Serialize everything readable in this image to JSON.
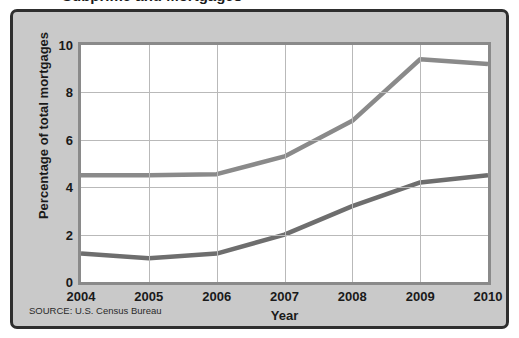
{
  "figure": {
    "title_cropped": "Subprime and Mortgages",
    "source_note": "SOURCE: U.S. Census Bureau",
    "panel_bg": "#c9c9c9",
    "plot_bg": "#ffffff",
    "border_color": "#2e2e2e"
  },
  "chart_data": {
    "type": "line",
    "title": "",
    "xlabel": "Year",
    "ylabel": "Percentage of total mortgages",
    "x": [
      2004,
      2005,
      2006,
      2007,
      2008,
      2009,
      2010
    ],
    "xtick_labels": [
      "2004",
      "2005",
      "2006",
      "2007",
      "2008",
      "2009",
      "2010"
    ],
    "ytick_labels": [
      "0",
      "2",
      "4",
      "6",
      "8",
      "10"
    ],
    "yticks": [
      0,
      2,
      4,
      6,
      8,
      10
    ],
    "xlim": [
      2004,
      2010
    ],
    "ylim": [
      0,
      10
    ],
    "grid": true,
    "legend": "none",
    "series": [
      {
        "name": "upper-line",
        "color": "#8a8a8a",
        "values": [
          4.5,
          4.5,
          4.55,
          5.3,
          6.8,
          9.4,
          9.2
        ]
      },
      {
        "name": "lower-line",
        "color": "#6e6e6e",
        "values": [
          1.2,
          1.0,
          1.2,
          2.0,
          3.2,
          4.2,
          4.5
        ]
      }
    ]
  }
}
